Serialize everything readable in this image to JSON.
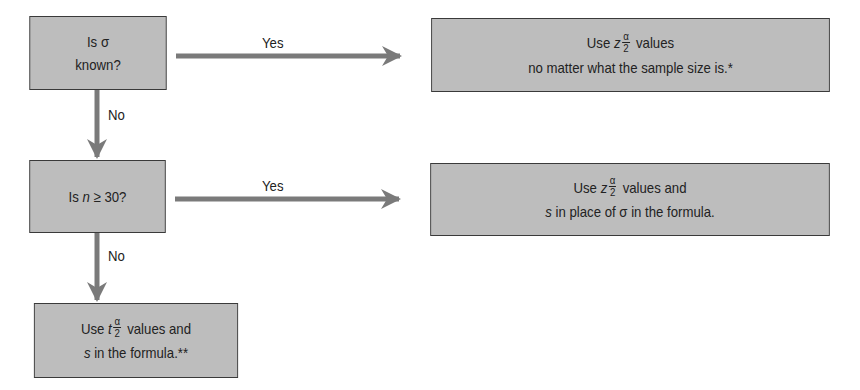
{
  "diagram": {
    "type": "flowchart",
    "nodes": {
      "q1": {
        "prefix": "Is ",
        "symbol": "σ",
        "line2": "known?"
      },
      "r1": {
        "use": "Use ",
        "var": "z",
        "frac_num": "α",
        "frac_den": "2",
        "after": " values",
        "line2": "no matter what the sample size is.*"
      },
      "q2": {
        "prefix": "Is ",
        "var": "n",
        "rest": " ≥ 30?"
      },
      "r2": {
        "use": "Use ",
        "var": "z",
        "frac_num": "α",
        "frac_den": "2",
        "after": " values and",
        "line2_var": "s",
        "line2_mid": " in place of ",
        "line2_sym": "σ",
        "line2_end": " in the formula."
      },
      "r3": {
        "use": "Use ",
        "var": "t",
        "frac_num": "α",
        "frac_den": "2",
        "after": " values and",
        "line2_var": "s",
        "line2_end": " in the formula.**"
      }
    },
    "edges": [
      {
        "from": "q1",
        "to": "r1",
        "label": "Yes"
      },
      {
        "from": "q1",
        "to": "q2",
        "label": "No"
      },
      {
        "from": "q2",
        "to": "r2",
        "label": "Yes"
      },
      {
        "from": "q2",
        "to": "r3",
        "label": "No"
      }
    ],
    "colors": {
      "box_fill": "#bdbdbd",
      "border": "#3a3a3a",
      "arrow": "#7a7a7a"
    }
  }
}
